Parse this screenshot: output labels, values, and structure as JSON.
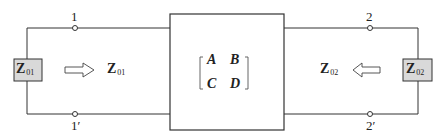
{
  "diagram": {
    "port1": {
      "top_terminal": "1",
      "bottom_terminal": "1′",
      "impedance_box": {
        "main": "Z",
        "sub": "01"
      },
      "arrow_direction": "right",
      "impedance_label": {
        "main": "Z",
        "sub": "01"
      }
    },
    "network": {
      "matrix": [
        [
          "A",
          "B"
        ],
        [
          "C",
          "D"
        ]
      ]
    },
    "port2": {
      "top_terminal": "2",
      "bottom_terminal": "2′",
      "impedance_box": {
        "main": "Z",
        "sub": "02"
      },
      "arrow_direction": "left",
      "impedance_label": {
        "main": "Z",
        "sub": "02"
      }
    },
    "colors": {
      "line": "#333333",
      "impedance_box_fill": "#d9d9d9",
      "background": "#ffffff"
    }
  }
}
